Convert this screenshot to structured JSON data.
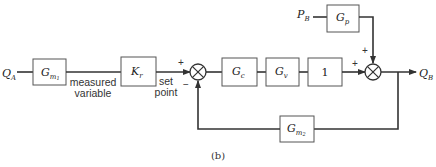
{
  "diagram": {
    "inputs": {
      "qa": "Q",
      "qa_sub": "A",
      "pb": "P",
      "pb_sub": "B"
    },
    "output": {
      "qb": "Q",
      "qb_sub": "B"
    },
    "blocks": {
      "gm1": {
        "main": "G",
        "sub": "m",
        "subsub": "1"
      },
      "kr": {
        "main": "K",
        "sub": "r"
      },
      "gc": {
        "main": "G",
        "sub": "c"
      },
      "gv": {
        "main": "G",
        "sub": "v"
      },
      "one": {
        "main": "1"
      },
      "gp": {
        "main": "G",
        "sub": "p"
      },
      "gm2": {
        "main": "G",
        "sub": "m",
        "subsub": "2"
      }
    },
    "labels": {
      "measured_line1": "measured",
      "measured_line2": "variable",
      "setpoint_line1": "set",
      "setpoint_line2": "point",
      "plus": "+",
      "minus": "−"
    },
    "caption": "(b)"
  }
}
